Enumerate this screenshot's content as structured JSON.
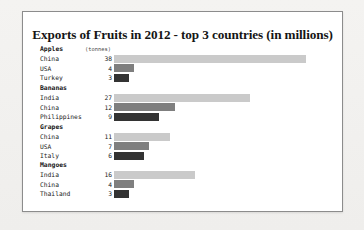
{
  "chart_data": {
    "type": "bar",
    "title": "Exports of Fruits in 2012 - top 3 countries (in millions)",
    "xlabel": "",
    "ylabel": "",
    "units_label": "(tonnes)",
    "orientation": "horizontal",
    "grid": false,
    "legend": "none",
    "xlim": [
      0,
      38
    ],
    "value_unit": "millions of tonnes",
    "series_colors": {
      "rank1": "#cacaca",
      "rank2": "#7f7f7f",
      "rank3": "#333333"
    },
    "groups": [
      {
        "name": "Apples",
        "categories": [
          "China",
          "USA",
          "Turkey"
        ],
        "values": [
          38,
          4,
          3
        ]
      },
      {
        "name": "Bananas",
        "categories": [
          "India",
          "China",
          "Philippines"
        ],
        "values": [
          27,
          12,
          9
        ]
      },
      {
        "name": "Grapes",
        "categories": [
          "China",
          "USA",
          "Italy"
        ],
        "values": [
          11,
          7,
          6
        ]
      },
      {
        "name": "Mangoes",
        "categories": [
          "India",
          "China",
          "Thailand"
        ],
        "values": [
          16,
          4,
          3
        ]
      }
    ]
  }
}
